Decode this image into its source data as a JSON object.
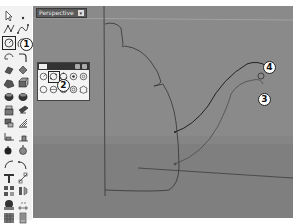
{
  "viewport": {
    "title": "Perspective",
    "dropdown_glyph": "▾",
    "background": "#8a8a8a",
    "ground_color": "#7e7e7e"
  },
  "toolbar": {
    "tools": [
      {
        "name": "select-arrow",
        "glyph": "arrow"
      },
      {
        "name": "point",
        "glyph": "point"
      },
      {
        "name": "polyline",
        "glyph": "polyline"
      },
      {
        "name": "curve",
        "glyph": "curve"
      },
      {
        "name": "circle",
        "glyph": "circle"
      },
      {
        "name": "arc",
        "glyph": "arc"
      },
      {
        "name": "ellipse",
        "glyph": "ellipse"
      },
      {
        "name": "fillet-curves",
        "glyph": "fillet"
      },
      {
        "name": "rectangle",
        "glyph": "rectangle"
      },
      {
        "name": "polygon",
        "glyph": "polygon"
      },
      {
        "name": "surface-from-points",
        "glyph": "surface"
      },
      {
        "name": "extrude",
        "glyph": "extrude"
      },
      {
        "name": "box",
        "glyph": "box"
      },
      {
        "name": "sphere",
        "glyph": "sphere"
      },
      {
        "name": "boolean-union",
        "glyph": "boolean"
      },
      {
        "name": "boolean-difference",
        "glyph": "boolean-diff"
      },
      {
        "name": "loft",
        "glyph": "loft"
      },
      {
        "name": "sweep",
        "glyph": "sweep"
      },
      {
        "name": "fillet-edge",
        "glyph": "fillet-edge"
      },
      {
        "name": "shell",
        "glyph": "shell"
      },
      {
        "name": "blend-curve",
        "glyph": "blend"
      },
      {
        "name": "offset",
        "glyph": "offset"
      },
      {
        "name": "text",
        "glyph": "text"
      },
      {
        "name": "transform",
        "glyph": "transform"
      },
      {
        "name": "array",
        "glyph": "array"
      },
      {
        "name": "mirror",
        "glyph": "mirror"
      },
      {
        "name": "render",
        "glyph": "render"
      },
      {
        "name": "dimension",
        "glyph": "dimension"
      },
      {
        "name": "mesh",
        "glyph": "mesh"
      },
      {
        "name": "properties",
        "glyph": "properties"
      }
    ]
  },
  "flyout": {
    "title": "Circle",
    "tools": [
      {
        "name": "circle-center-radius"
      },
      {
        "name": "circle-2-point"
      },
      {
        "name": "circle-3-point"
      },
      {
        "name": "circle-tangent"
      },
      {
        "name": "circle-tangent-3"
      },
      {
        "name": "circle-around-curve"
      },
      {
        "name": "circle-vertical"
      },
      {
        "name": "circle-fit-points"
      },
      {
        "name": "circle-tangent-tangent-radius"
      },
      {
        "name": "circle-deformable"
      }
    ]
  },
  "callouts": [
    {
      "label": "1",
      "x": 21,
      "y": 39
    },
    {
      "label": "2",
      "x": 58,
      "y": 80
    },
    {
      "label": "3",
      "x": 259,
      "y": 94
    },
    {
      "label": "4",
      "x": 264,
      "y": 62
    }
  ]
}
